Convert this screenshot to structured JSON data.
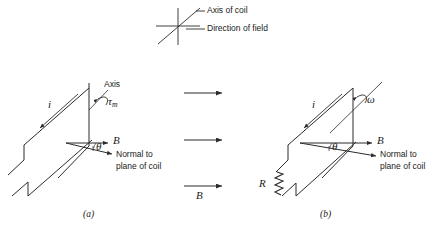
{
  "figure": {
    "background_color": "#ffffff",
    "line_color": "#2b2b2b",
    "legend": {
      "axis_label": "Axis of coil",
      "field_label": "Direction of field",
      "axis_symbol_name": "diagonal-line",
      "field_symbol_name": "horizontal-line"
    },
    "field_arrows": {
      "count": 3,
      "label": "B"
    },
    "panel_a": {
      "caption": "(a)",
      "current_label": "i",
      "axis_label": "Axis",
      "torque_label": "τ",
      "torque_subscript": "m",
      "field_label": "B",
      "angle_label": "θ",
      "normal_label_line1": "Normal to",
      "normal_label_line2": "plane of coil"
    },
    "panel_b": {
      "caption": "(b)",
      "current_label": "i",
      "omega_label": "ω",
      "resistor_label": "R",
      "field_label": "B",
      "angle_label": "θ",
      "normal_label_line1": "Normal to",
      "normal_label_line2": "plane of coil"
    }
  }
}
